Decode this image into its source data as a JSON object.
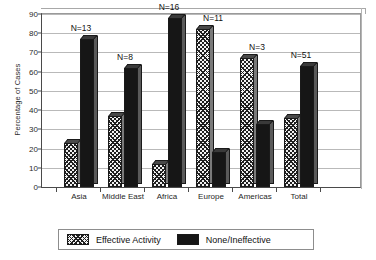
{
  "chart_data": {
    "type": "bar",
    "title": "",
    "xlabel": "",
    "ylabel": "Percentage of Cases",
    "ylim": [
      0,
      90
    ],
    "yticks": [
      0,
      10,
      20,
      30,
      40,
      50,
      60,
      70,
      80,
      90
    ],
    "grid": true,
    "legend_position": "bottom",
    "categories": [
      "Asia",
      "Middle East",
      "Africa",
      "Europe",
      "Americas",
      "Total"
    ],
    "series": [
      {
        "name": "Effective Activity",
        "values": [
          23,
          37,
          12,
          82,
          67,
          36
        ]
      },
      {
        "name": "None/Ineffective",
        "values": [
          77,
          62,
          88,
          18,
          33,
          63
        ]
      }
    ],
    "annotations": [
      {
        "category": "Asia",
        "text": "N=13"
      },
      {
        "category": "Middle East",
        "text": "N=8"
      },
      {
        "category": "Africa",
        "text": "N=16"
      },
      {
        "category": "Europe",
        "text": "N=11"
      },
      {
        "category": "Americas",
        "text": "N=3"
      },
      {
        "category": "Total",
        "text": "N=51"
      }
    ],
    "colors": {
      "effective_activity": "#f2f2f2",
      "none_ineffective": "#161616",
      "gridline": "#b9b9b9",
      "axis": "#4a4a4a"
    }
  },
  "legend": {
    "items": [
      {
        "label": "Effective Activity",
        "pattern": "hatch"
      },
      {
        "label": "None/Ineffective",
        "pattern": "solid"
      }
    ]
  }
}
